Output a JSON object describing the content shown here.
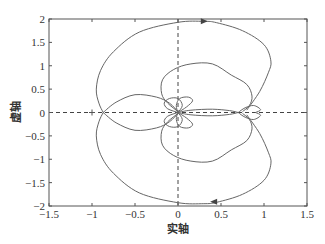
{
  "chart_data": {
    "type": "line",
    "title": "",
    "xlabel": "实轴",
    "ylabel": "虚轴",
    "xlim": [
      -1.5,
      1.5
    ],
    "ylim": [
      -2,
      2
    ],
    "xticks": [
      -1.5,
      -1,
      -0.5,
      0,
      0.5,
      1,
      1.5
    ],
    "xtick_labels": [
      "-1.5",
      "-1",
      "-0.5",
      "0",
      "0.5",
      "1",
      "1.5"
    ],
    "yticks": [
      -2,
      -1.5,
      -1,
      -0.5,
      0,
      0.5,
      1,
      1.5,
      2
    ],
    "ytick_labels": [
      "-2",
      "-1.5",
      "-1",
      "-0.5",
      "0",
      "0.5",
      "1",
      "1.5",
      "2"
    ],
    "grid": false,
    "legend": null,
    "reference_lines": [
      {
        "orientation": "horizontal",
        "value": 0,
        "style": "dashed"
      },
      {
        "orientation": "vertical",
        "value": 0,
        "style": "dashed"
      }
    ],
    "markers": [
      {
        "symbol": "+",
        "x": -1,
        "y": 0,
        "label": "critical point"
      }
    ],
    "arrows": [
      {
        "x": 0.3,
        "y": 1.95,
        "direction": "right"
      },
      {
        "x": 0.42,
        "y": -1.91,
        "direction": "left"
      }
    ],
    "symmetric_about_real_axis": true,
    "series": [
      {
        "name": "outer-loop",
        "points": [
          [
            0.8,
            0.05
          ],
          [
            0.95,
            0.45
          ],
          [
            1.05,
            0.85
          ],
          [
            1.08,
            1.1
          ],
          [
            1.0,
            1.45
          ],
          [
            0.75,
            1.75
          ],
          [
            0.45,
            1.92
          ],
          [
            0.3,
            1.95
          ],
          [
            0,
            1.93
          ],
          [
            -0.45,
            1.72
          ],
          [
            -0.75,
            1.3
          ],
          [
            -0.9,
            0.9
          ],
          [
            -0.95,
            0.5
          ],
          [
            -0.92,
            0.2
          ],
          [
            -0.87,
            0.0
          ]
        ]
      },
      {
        "name": "left-arc",
        "points": [
          [
            -0.87,
            0.0
          ],
          [
            -0.72,
            0.22
          ],
          [
            -0.5,
            0.38
          ],
          [
            -0.25,
            0.33
          ],
          [
            -0.1,
            0.2
          ],
          [
            0.0,
            0.02
          ]
        ]
      },
      {
        "name": "inner-loop",
        "points": [
          [
            0.75,
            0.02
          ],
          [
            0.83,
            0.15
          ],
          [
            0.86,
            0.35
          ],
          [
            0.8,
            0.6
          ],
          [
            0.62,
            0.8
          ],
          [
            0.4,
            1.04
          ],
          [
            0.15,
            1.04
          ],
          [
            -0.05,
            0.92
          ],
          [
            -0.18,
            0.7
          ],
          [
            -0.19,
            0.4
          ],
          [
            -0.12,
            0.2
          ],
          [
            0.0,
            0.02
          ]
        ]
      },
      {
        "name": "small-left-loop",
        "points": [
          [
            0.0,
            0.0
          ],
          [
            -0.12,
            0.08
          ],
          [
            -0.16,
            0.2
          ],
          [
            -0.1,
            0.3
          ],
          [
            0.0,
            0.3
          ],
          [
            0.05,
            0.15
          ],
          [
            0.0,
            0.0
          ]
        ]
      },
      {
        "name": "small-right-loop",
        "points": [
          [
            0.0,
            0.0
          ],
          [
            0.1,
            0.12
          ],
          [
            0.17,
            0.25
          ],
          [
            0.12,
            0.33
          ],
          [
            0.02,
            0.3
          ],
          [
            -0.02,
            0.15
          ],
          [
            0.0,
            0.0
          ]
        ]
      },
      {
        "name": "thin-lobe",
        "points": [
          [
            0.0,
            0.0
          ],
          [
            0.15,
            0.05
          ],
          [
            0.4,
            0.07
          ],
          [
            0.6,
            0.04
          ],
          [
            0.7,
            0.0
          ]
        ]
      },
      {
        "name": "right-small-loop",
        "points": [
          [
            0.7,
            0.0
          ],
          [
            0.78,
            0.1
          ],
          [
            0.88,
            0.15
          ],
          [
            0.96,
            0.06
          ],
          [
            0.9,
            0.0
          ]
        ]
      }
    ]
  }
}
